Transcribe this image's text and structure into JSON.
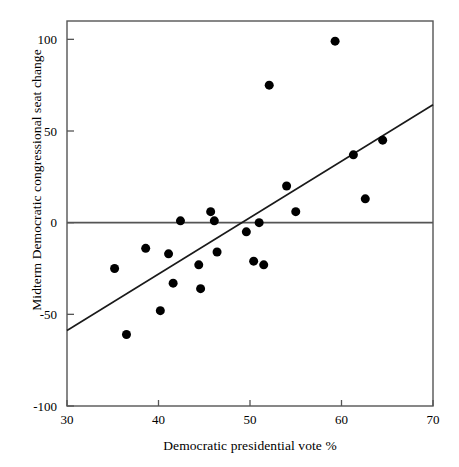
{
  "chart_data": {
    "type": "scatter",
    "title": "",
    "xlabel": "Democratic presidential vote %",
    "ylabel": "Midterm Democratic congressional seat change",
    "xlim": [
      30,
      70
    ],
    "ylim": [
      -100,
      110
    ],
    "xticks": [
      30,
      40,
      50,
      60,
      70
    ],
    "xticklabels": [
      "30",
      "40",
      "50",
      "60",
      "70"
    ],
    "yticks": [
      -100,
      -50,
      0,
      50,
      100
    ],
    "yticklabels": [
      "-100",
      "-50",
      "0",
      "50",
      "100"
    ],
    "grid": false,
    "legend": null,
    "frame": "box",
    "marker": "filled-circle",
    "marker_color": "#000000",
    "marker_size_px": 9,
    "points": [
      {
        "x": 35.2,
        "y": -25
      },
      {
        "x": 36.5,
        "y": -61
      },
      {
        "x": 38.6,
        "y": -14
      },
      {
        "x": 40.2,
        "y": -48
      },
      {
        "x": 41.1,
        "y": -17
      },
      {
        "x": 41.6,
        "y": -33
      },
      {
        "x": 42.4,
        "y": 1
      },
      {
        "x": 44.4,
        "y": -23
      },
      {
        "x": 44.6,
        "y": -36
      },
      {
        "x": 45.7,
        "y": 6
      },
      {
        "x": 46.1,
        "y": 1
      },
      {
        "x": 46.4,
        "y": -16
      },
      {
        "x": 49.6,
        "y": -5
      },
      {
        "x": 50.4,
        "y": -21
      },
      {
        "x": 51.0,
        "y": 0
      },
      {
        "x": 51.5,
        "y": -23
      },
      {
        "x": 52.1,
        "y": 75
      },
      {
        "x": 54.0,
        "y": 20
      },
      {
        "x": 55.0,
        "y": 6
      },
      {
        "x": 59.3,
        "y": 99
      },
      {
        "x": 61.3,
        "y": 37
      },
      {
        "x": 62.6,
        "y": 13
      },
      {
        "x": 64.5,
        "y": 45
      }
    ],
    "reference_lines": [
      {
        "name": "zero-line",
        "orientation": "horizontal",
        "y": 0
      }
    ],
    "fit_line": {
      "name": "regression-line",
      "x0": 30,
      "y0": -58.8,
      "x1": 70,
      "y1": 64.3
    },
    "axis_color": "#555555",
    "line_color": "#1a1a1a"
  }
}
